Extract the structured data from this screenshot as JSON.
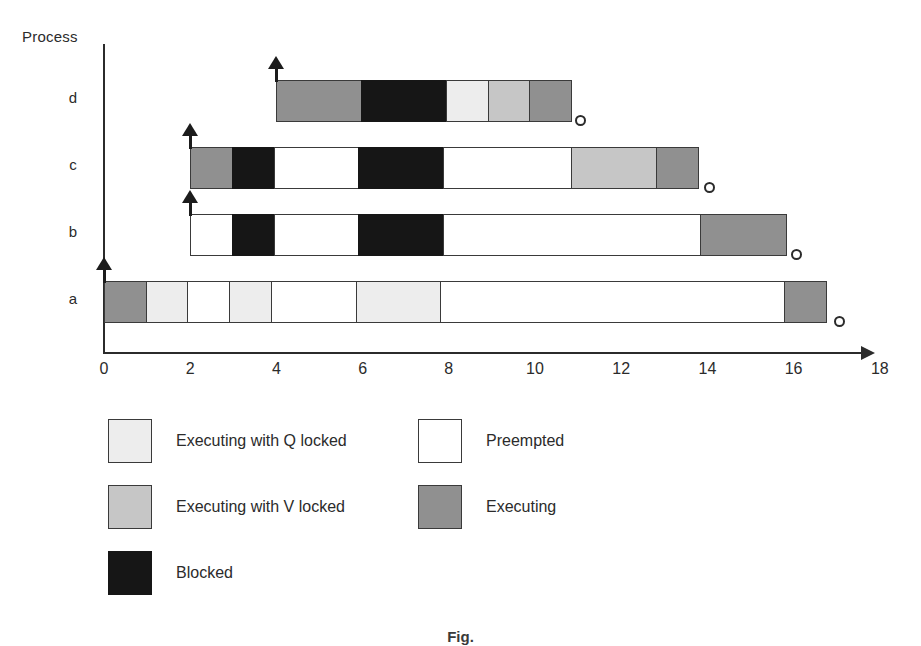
{
  "chart_data": {
    "type": "gantt",
    "title": "",
    "ylabel": "Process",
    "xlabel": "",
    "xlim": [
      0,
      18
    ],
    "xticks": [
      0,
      2,
      4,
      6,
      8,
      10,
      12,
      14,
      16,
      18
    ],
    "grid": false,
    "legend_position": "below",
    "categories": [
      "d",
      "c",
      "b",
      "a"
    ],
    "state_colors": {
      "executing_q_locked": "#ededed",
      "executing_v_locked": "#c6c6c6",
      "blocked": "#161616",
      "preempted": "#ffffff",
      "executing": "#909090"
    },
    "rows": [
      {
        "process": "d",
        "release_time": 4,
        "finish_time": 11,
        "segments": [
          {
            "state": "executing",
            "start": 4,
            "end": 6
          },
          {
            "state": "blocked",
            "start": 6,
            "end": 8
          },
          {
            "state": "executing_q_locked",
            "start": 8,
            "end": 9
          },
          {
            "state": "executing_v_locked",
            "start": 9,
            "end": 10
          },
          {
            "state": "executing",
            "start": 10,
            "end": 11
          }
        ]
      },
      {
        "process": "c",
        "release_time": 2,
        "finish_time": 14,
        "segments": [
          {
            "state": "executing",
            "start": 2,
            "end": 3
          },
          {
            "state": "blocked",
            "start": 3,
            "end": 4
          },
          {
            "state": "preempted",
            "start": 4,
            "end": 6
          },
          {
            "state": "blocked",
            "start": 6,
            "end": 8
          },
          {
            "state": "preempted",
            "start": 8,
            "end": 11
          },
          {
            "state": "executing_v_locked",
            "start": 11,
            "end": 13
          },
          {
            "state": "executing",
            "start": 13,
            "end": 14
          }
        ]
      },
      {
        "process": "b",
        "release_time": 2,
        "finish_time": 16,
        "segments": [
          {
            "state": "preempted",
            "start": 2,
            "end": 3
          },
          {
            "state": "blocked",
            "start": 3,
            "end": 4
          },
          {
            "state": "preempted",
            "start": 4,
            "end": 6
          },
          {
            "state": "blocked",
            "start": 6,
            "end": 8
          },
          {
            "state": "preempted",
            "start": 8,
            "end": 14
          },
          {
            "state": "executing",
            "start": 14,
            "end": 16
          }
        ]
      },
      {
        "process": "a",
        "release_time": 0,
        "finish_time": 17,
        "segments": [
          {
            "state": "executing",
            "start": 0,
            "end": 1
          },
          {
            "state": "executing_q_locked",
            "start": 1,
            "end": 2
          },
          {
            "state": "preempted",
            "start": 2,
            "end": 3
          },
          {
            "state": "executing_q_locked",
            "start": 3,
            "end": 4
          },
          {
            "state": "preempted",
            "start": 4,
            "end": 6
          },
          {
            "state": "executing_q_locked",
            "start": 6,
            "end": 8
          },
          {
            "state": "preempted",
            "start": 8,
            "end": 16
          },
          {
            "state": "executing",
            "start": 16,
            "end": 17
          }
        ]
      }
    ],
    "legend": [
      {
        "state": "executing_q_locked",
        "label": "Executing with Q locked",
        "column": "left"
      },
      {
        "state": "executing_v_locked",
        "label": "Executing with V locked",
        "column": "left"
      },
      {
        "state": "blocked",
        "label": "Blocked",
        "column": "left"
      },
      {
        "state": "preempted",
        "label": "Preempted",
        "column": "right"
      },
      {
        "state": "executing",
        "label": "Executing",
        "column": "right"
      }
    ]
  },
  "axis": {
    "y_title": "Process",
    "tick_labels": [
      "0",
      "2",
      "4",
      "6",
      "8",
      "10",
      "12",
      "14",
      "16",
      "18"
    ],
    "row_labels": [
      "d",
      "c",
      "b",
      "a"
    ]
  },
  "legend": {
    "items": [
      {
        "label": "Executing with Q locked"
      },
      {
        "label": "Executing with V locked"
      },
      {
        "label": "Blocked"
      },
      {
        "label": "Preempted"
      },
      {
        "label": "Executing"
      }
    ]
  },
  "caption": {
    "text": "Fig."
  }
}
